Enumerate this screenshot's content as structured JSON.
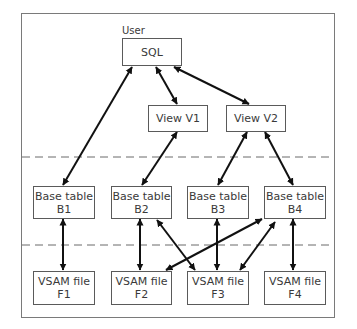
{
  "diagram": {
    "user_label": "User",
    "nodes": {
      "sql": {
        "line1": "SQL",
        "line2": ""
      },
      "v1": {
        "line1": "View V1",
        "line2": ""
      },
      "v2": {
        "line1": "View V2",
        "line2": ""
      },
      "b1": {
        "line1": "Base table",
        "line2": "B1"
      },
      "b2": {
        "line1": "Base table",
        "line2": "B2"
      },
      "b3": {
        "line1": "Base table",
        "line2": "B3"
      },
      "b4": {
        "line1": "Base table",
        "line2": "B4"
      },
      "f1": {
        "line1": "VSAM file",
        "line2": "F1"
      },
      "f2": {
        "line1": "VSAM file",
        "line2": "F2"
      },
      "f3": {
        "line1": "VSAM file",
        "line2": "F3"
      },
      "f4": {
        "line1": "VSAM file",
        "line2": "F4"
      }
    },
    "edges": [
      {
        "from": "SQL",
        "to": "Base table B1",
        "type": "bidirectional"
      },
      {
        "from": "SQL",
        "to": "View V1",
        "type": "bidirectional"
      },
      {
        "from": "SQL",
        "to": "View V2",
        "type": "bidirectional"
      },
      {
        "from": "View V1",
        "to": "Base table B2",
        "type": "bidirectional"
      },
      {
        "from": "View V2",
        "to": "Base table B3",
        "type": "bidirectional"
      },
      {
        "from": "View V2",
        "to": "Base table B4",
        "type": "bidirectional"
      },
      {
        "from": "Base table B1",
        "to": "VSAM file F1",
        "type": "bidirectional"
      },
      {
        "from": "Base table B2",
        "to": "VSAM file F2",
        "type": "bidirectional"
      },
      {
        "from": "Base table B2",
        "to": "VSAM file F3",
        "type": "bidirectional"
      },
      {
        "from": "Base table B3",
        "to": "VSAM file F3",
        "type": "bidirectional"
      },
      {
        "from": "Base table B4",
        "to": "VSAM file F2",
        "type": "bidirectional"
      },
      {
        "from": "Base table B4",
        "to": "VSAM file F3",
        "type": "bidirectional"
      },
      {
        "from": "Base table B4",
        "to": "VSAM file F4",
        "type": "bidirectional"
      }
    ],
    "layers": [
      "User / views layer",
      "Base tables layer",
      "VSAM files layer"
    ],
    "colors": {
      "line": "#111111",
      "box_border": "#5a5a5a",
      "dash": "#6a6a6a",
      "frame": "#7a7a7a"
    }
  }
}
